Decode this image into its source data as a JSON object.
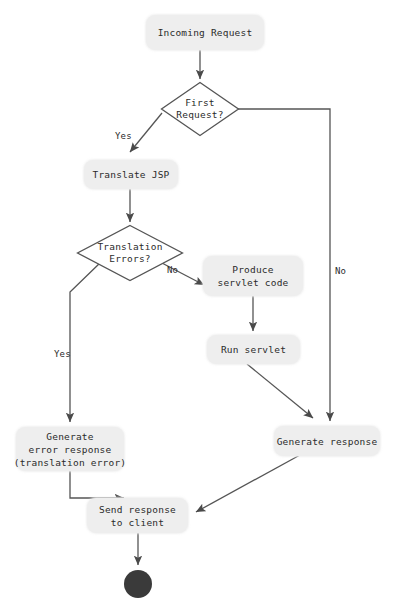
{
  "diagram": {
    "type": "flowchart",
    "colors": {
      "node_fill": "#eeeeee",
      "node_text": "#2b2b2b",
      "edge_stroke": "#555555",
      "end_node_fill": "#3a3a3a",
      "background": "#ffffff"
    },
    "nodes": {
      "incoming_request": {
        "shape": "rounded-rect",
        "label": "Incoming Request",
        "lines": [
          "Incoming Request"
        ]
      },
      "first_request": {
        "shape": "diamond",
        "label": "First Request?",
        "lines": [
          "First",
          "Request?"
        ]
      },
      "translate_jsp": {
        "shape": "rounded-rect",
        "label": "Translate JSP",
        "lines": [
          "Translate JSP"
        ]
      },
      "translation_errors": {
        "shape": "diamond",
        "label": "Translation Errors?",
        "lines": [
          "Translation",
          "Errors?"
        ]
      },
      "produce_servlet_code": {
        "shape": "rounded-rect",
        "label": "Produce servlet code",
        "lines": [
          "Produce",
          "servlet code"
        ]
      },
      "run_servlet": {
        "shape": "rounded-rect",
        "label": "Run servlet",
        "lines": [
          "Run servlet"
        ]
      },
      "generate_error_response": {
        "shape": "rounded-rect",
        "label": "Generate error response (translation error)",
        "lines": [
          "Generate",
          "error response",
          "(translation error)"
        ]
      },
      "generate_response": {
        "shape": "rounded-rect",
        "label": "Generate response",
        "lines": [
          "Generate response"
        ]
      },
      "send_response_to_client": {
        "shape": "rounded-rect",
        "label": "Send response to client",
        "lines": [
          "Send response",
          "to client"
        ]
      },
      "end_state": {
        "shape": "filled-circle",
        "label": ""
      }
    },
    "edge_labels": {
      "first_request_yes": "Yes",
      "first_request_no": "No",
      "translation_errors_yes": "Yes",
      "translation_errors_no": "No"
    },
    "edges": [
      {
        "from": "incoming_request",
        "to": "first_request",
        "label": ""
      },
      {
        "from": "first_request",
        "to": "translate_jsp",
        "label": "Yes"
      },
      {
        "from": "first_request",
        "to": "generate_response",
        "label": "No"
      },
      {
        "from": "translate_jsp",
        "to": "translation_errors",
        "label": ""
      },
      {
        "from": "translation_errors",
        "to": "generate_error_response",
        "label": "Yes"
      },
      {
        "from": "translation_errors",
        "to": "produce_servlet_code",
        "label": "No"
      },
      {
        "from": "produce_servlet_code",
        "to": "run_servlet",
        "label": ""
      },
      {
        "from": "run_servlet",
        "to": "generate_response",
        "label": ""
      },
      {
        "from": "generate_error_response",
        "to": "send_response_to_client",
        "label": ""
      },
      {
        "from": "generate_response",
        "to": "send_response_to_client",
        "label": ""
      },
      {
        "from": "send_response_to_client",
        "to": "end_state",
        "label": ""
      }
    ]
  }
}
